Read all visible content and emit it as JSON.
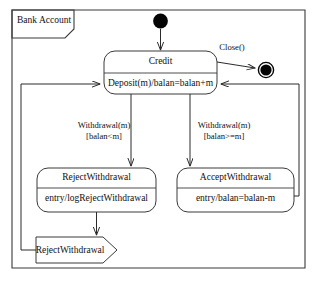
{
  "frame": {
    "label": "Bank Account"
  },
  "nodes": {
    "initial": {
      "name": "initial-state"
    },
    "final": {
      "name": "final-state"
    },
    "credit": {
      "title": "Credit",
      "body": "Deposit(m)/balan=balan+m"
    },
    "reject": {
      "title": "RejectWithdrawal",
      "body": "entry/logRejectWithdrawal"
    },
    "accept": {
      "title": "AcceptWithdrawal",
      "body": "entry/balan=balan-m"
    },
    "signal": {
      "label": "RejectWithdrawal"
    }
  },
  "transitions": {
    "close": {
      "label": "Close()"
    },
    "to_reject": {
      "event": "Withdrawal(m)",
      "guard": "[balan<m]"
    },
    "to_accept": {
      "event": "Withdrawal(m)",
      "guard": "[balan>=m]"
    }
  },
  "colors": {
    "line": "#2b2b2b",
    "frame": "#3a3a3a",
    "fill": "#ffffff",
    "node": "#050505",
    "background": "#ffffff"
  }
}
